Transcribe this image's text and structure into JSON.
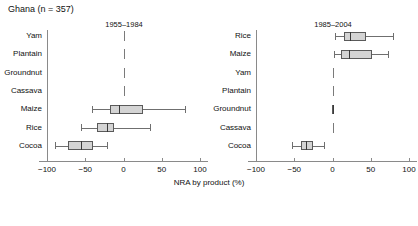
{
  "figure": {
    "title": "Ghana (n = 357)",
    "xlabel": "NRA by product (%)",
    "background": "#ffffff",
    "box_fill": "#d4d4d4",
    "box_stroke": "#5a5a5a"
  },
  "chart_data": {
    "type": "boxplot",
    "title": "Ghana (n = 357)",
    "xlabel": "NRA by product (%)",
    "ylabel": "",
    "xlim": [
      -100,
      100
    ],
    "xticks": [
      -100,
      -50,
      0,
      50,
      100
    ],
    "xticklabels": [
      "−100",
      "−50",
      "0",
      "50",
      "100"
    ],
    "grid": false,
    "legend": "none",
    "reference_line": 0,
    "panels": [
      {
        "name": "panel-1955-1984",
        "title": "1955–1984",
        "categories": [
          "Yam",
          "Plantain",
          "Groundnut",
          "Cassava",
          "Maize",
          "Rice",
          "Cocoa"
        ],
        "boxes": [
          {
            "category": "Yam",
            "whisker_low": 0,
            "q1": 0,
            "median": 0,
            "q3": 0,
            "whisker_high": 0,
            "degenerate": true
          },
          {
            "category": "Plantain",
            "whisker_low": 0,
            "q1": 0,
            "median": 0,
            "q3": 0,
            "whisker_high": 0,
            "degenerate": true
          },
          {
            "category": "Groundnut",
            "whisker_low": 0,
            "q1": 0,
            "median": 0,
            "q3": 0,
            "whisker_high": 0,
            "degenerate": true
          },
          {
            "category": "Cassava",
            "whisker_low": 0,
            "q1": 0,
            "median": 0,
            "q3": 0,
            "whisker_high": 0,
            "degenerate": true
          },
          {
            "category": "Maize",
            "whisker_low": -41,
            "q1": -17,
            "median": -6,
            "q3": 26,
            "whisker_high": 81,
            "degenerate": false
          },
          {
            "category": "Rice",
            "whisker_low": -55,
            "q1": -34,
            "median": -22,
            "q3": -12,
            "whisker_high": 35,
            "degenerate": false
          },
          {
            "category": "Cocoa",
            "whisker_low": -89,
            "q1": -72,
            "median": -56,
            "q3": -40,
            "whisker_high": -21,
            "degenerate": false
          }
        ]
      },
      {
        "name": "panel-1985-2004",
        "title": "1985–2004",
        "categories": [
          "Rice",
          "Maize",
          "Yam",
          "Plantain",
          "Groundnut",
          "Cassava",
          "Cocoa"
        ],
        "boxes": [
          {
            "category": "Rice",
            "whisker_low": 3,
            "q1": 15,
            "median": 23,
            "q3": 44,
            "whisker_high": 79,
            "degenerate": false
          },
          {
            "category": "Maize",
            "whisker_low": 2,
            "q1": 11,
            "median": 22,
            "q3": 52,
            "whisker_high": 72,
            "degenerate": false
          },
          {
            "category": "Yam",
            "whisker_low": 0,
            "q1": 0,
            "median": 0,
            "q3": 0,
            "whisker_high": 0,
            "degenerate": true
          },
          {
            "category": "Plantain",
            "whisker_low": 0,
            "q1": 0,
            "median": 0,
            "q3": 0,
            "whisker_high": 0,
            "degenerate": true
          },
          {
            "category": "Groundnut",
            "whisker_low": 0,
            "q1": -1,
            "median": 0,
            "q3": 1,
            "whisker_high": 1,
            "degenerate": false
          },
          {
            "category": "Cassava",
            "whisker_low": 0,
            "q1": 0,
            "median": 0,
            "q3": 0,
            "whisker_high": 0,
            "degenerate": true
          },
          {
            "category": "Cocoa",
            "whisker_low": -53,
            "q1": -41,
            "median": -34,
            "q3": -26,
            "whisker_high": -11,
            "degenerate": false
          }
        ]
      }
    ]
  }
}
